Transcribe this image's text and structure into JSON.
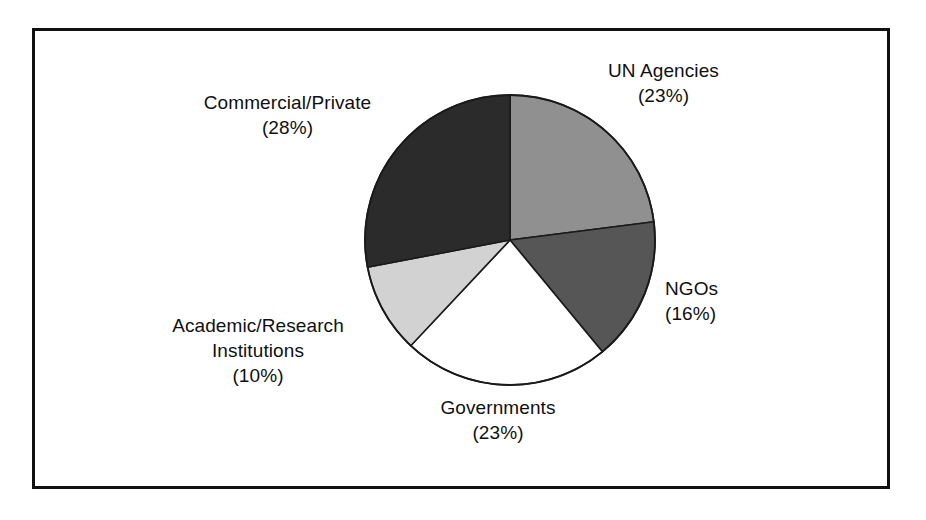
{
  "figure": {
    "background_color": "#ffffff",
    "border_color": "#111111"
  },
  "chart_data": {
    "type": "pie",
    "title": "",
    "subtitle": "",
    "xlabel": "",
    "ylabel": "",
    "legend_position": "none",
    "grid": false,
    "units": "percent",
    "start_angle_deg": 0,
    "direction": "clockwise",
    "categories": [
      "UN Agencies",
      "NGOs",
      "Governments",
      "Academic/Research Institutions",
      "Commercial/Private"
    ],
    "values": [
      23,
      16,
      23,
      10,
      28
    ],
    "slice_colors": [
      "#909090",
      "#565656",
      "#ffffff",
      "#d2d2d2",
      "#2b2b2b"
    ],
    "slices": [
      {
        "name": "UN Agencies",
        "value": 23,
        "value_text": "(23%)",
        "color": "#909090",
        "start_deg": 0,
        "end_deg": 82.8
      },
      {
        "name": "NGOs",
        "value": 16,
        "value_text": "(16%)",
        "color": "#565656",
        "start_deg": 82.8,
        "end_deg": 140.4
      },
      {
        "name": "Governments",
        "value": 23,
        "value_text": "(23%)",
        "color": "#ffffff",
        "start_deg": 140.4,
        "end_deg": 223.2
      },
      {
        "name": "Academic/Research Institutions",
        "value": 10,
        "value_text": "(10%)",
        "color": "#d2d2d2",
        "start_deg": 223.2,
        "end_deg": 259.2
      },
      {
        "name": "Commercial/Private",
        "value": 28,
        "value_text": "(28%)",
        "color": "#2b2b2b",
        "start_deg": 259.2,
        "end_deg": 360
      }
    ]
  },
  "labels": {
    "un_agencies": {
      "name": "UN Agencies",
      "percent": "(23%)"
    },
    "ngos": {
      "name": "NGOs",
      "percent": "(16%)"
    },
    "governments": {
      "name": "Governments",
      "percent": "(23%)"
    },
    "academic": {
      "line1": "Academic/Research",
      "line2": "Institutions",
      "percent": "(10%)"
    },
    "commercial": {
      "name": "Commercial/Private",
      "percent": "(28%)"
    }
  }
}
